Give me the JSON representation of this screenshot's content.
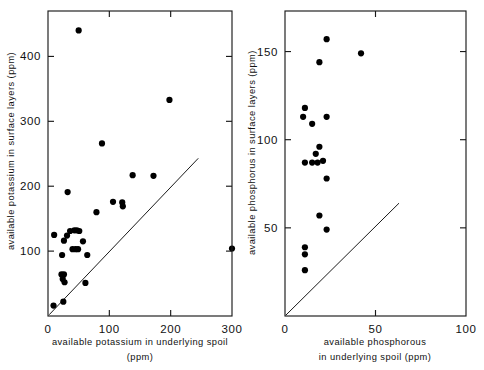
{
  "figure": {
    "background": "#ffffff",
    "ink": "#000000",
    "width": 484,
    "height": 370
  },
  "chart_data": [
    {
      "type": "scatter",
      "panel": "left",
      "title": "",
      "xlabel": "available potassium in underlying spoil",
      "xlabel_units": "(ppm)",
      "ylabel": "available potassium in surface layers (ppm)",
      "xlim": [
        0,
        300
      ],
      "ylim": [
        0,
        470
      ],
      "xticks": [
        0,
        100,
        200,
        300
      ],
      "xticklabels": [
        "0",
        "100",
        "200",
        "300"
      ],
      "yticks": [
        100,
        200,
        300,
        400
      ],
      "yticklabels": [
        "100",
        "200",
        "300",
        "400"
      ],
      "grid": false,
      "legend": "none",
      "reference_line": {
        "label": "1:1 line",
        "x": [
          2,
          245
        ],
        "y": [
          2,
          243
        ]
      },
      "points": [
        {
          "x": 50,
          "y": 440
        },
        {
          "x": 198,
          "y": 333
        },
        {
          "x": 88,
          "y": 266
        },
        {
          "x": 138,
          "y": 217
        },
        {
          "x": 172,
          "y": 216
        },
        {
          "x": 32,
          "y": 191
        },
        {
          "x": 106,
          "y": 176
        },
        {
          "x": 121,
          "y": 175
        },
        {
          "x": 122,
          "y": 169
        },
        {
          "x": 79,
          "y": 160
        },
        {
          "x": 36,
          "y": 131
        },
        {
          "x": 43,
          "y": 132
        },
        {
          "x": 47,
          "y": 132
        },
        {
          "x": 51,
          "y": 131
        },
        {
          "x": 10,
          "y": 125
        },
        {
          "x": 31,
          "y": 124
        },
        {
          "x": 26,
          "y": 116
        },
        {
          "x": 57,
          "y": 115
        },
        {
          "x": 40,
          "y": 103
        },
        {
          "x": 45,
          "y": 103
        },
        {
          "x": 49,
          "y": 103
        },
        {
          "x": 300,
          "y": 104
        },
        {
          "x": 23,
          "y": 94
        },
        {
          "x": 64,
          "y": 94
        },
        {
          "x": 22,
          "y": 64
        },
        {
          "x": 26,
          "y": 64
        },
        {
          "x": 24,
          "y": 57
        },
        {
          "x": 27,
          "y": 52
        },
        {
          "x": 61,
          "y": 51
        },
        {
          "x": 25,
          "y": 22
        },
        {
          "x": 9,
          "y": 16
        }
      ]
    },
    {
      "type": "scatter",
      "panel": "right",
      "title": "",
      "xlabel_line1": "available phosphorous",
      "xlabel_line2": "in underlying spoil (ppm)",
      "ylabel": "available phosphorus in surface layers  (ppm)",
      "xlim": [
        0,
        100
      ],
      "ylim": [
        0,
        173
      ],
      "xticks": [
        0,
        50,
        100
      ],
      "xticklabels": [
        "0",
        "50",
        "100"
      ],
      "yticks": [
        50,
        100,
        150
      ],
      "yticklabels": [
        "50",
        "100",
        "150"
      ],
      "grid": false,
      "legend": "none",
      "reference_line": {
        "label": "1:1 line",
        "x": [
          0.5,
          63
        ],
        "y": [
          0.5,
          64
        ]
      },
      "points": [
        {
          "x": 23,
          "y": 157
        },
        {
          "x": 42,
          "y": 149
        },
        {
          "x": 19,
          "y": 144
        },
        {
          "x": 11,
          "y": 118
        },
        {
          "x": 10,
          "y": 113
        },
        {
          "x": 23,
          "y": 113
        },
        {
          "x": 15,
          "y": 109
        },
        {
          "x": 19,
          "y": 96
        },
        {
          "x": 17,
          "y": 92
        },
        {
          "x": 11,
          "y": 87
        },
        {
          "x": 15,
          "y": 87
        },
        {
          "x": 18,
          "y": 87
        },
        {
          "x": 21,
          "y": 88
        },
        {
          "x": 23,
          "y": 78
        },
        {
          "x": 19,
          "y": 57
        },
        {
          "x": 23,
          "y": 49
        },
        {
          "x": 11,
          "y": 39
        },
        {
          "x": 11,
          "y": 35
        },
        {
          "x": 11,
          "y": 26
        }
      ]
    }
  ],
  "left_panel": {
    "name": "potassium-scatter",
    "ylabel": "available potassium in surface layers (ppm)",
    "xlabel_line1": "available potassium in underlying spoil",
    "xlabel_line2": "(ppm)"
  },
  "right_panel": {
    "name": "phosphorus-scatter",
    "ylabel": "available phosphorus in surface layers  (ppm)",
    "xlabel_line1": "available phosphorous",
    "xlabel_line2": "in underlying spoil (ppm)"
  }
}
